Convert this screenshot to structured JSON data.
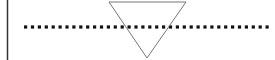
{
  "canvas": {
    "width": 275,
    "height": 60,
    "background": "#ffffff"
  },
  "vertical_line": {
    "x": 7.5,
    "y1": 0,
    "y2": 60,
    "color": "#333333",
    "width": 1.5
  },
  "dotted_line": {
    "x1": 24,
    "x2": 270,
    "y": 27,
    "dot_size": 3.2,
    "pitch": 6.9,
    "color": "#111111"
  },
  "triangle": {
    "points": "109,2 186,2 147,58",
    "stroke": "#777777",
    "fill": "none",
    "stroke_width": 1
  }
}
